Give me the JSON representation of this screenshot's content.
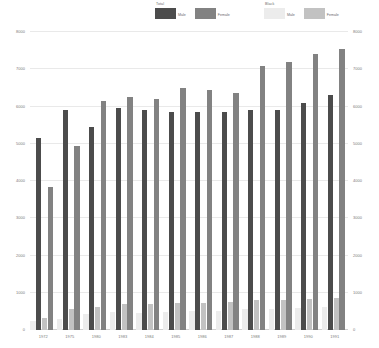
{
  "legend": {
    "groups": [
      {
        "title": "Total",
        "entries": [
          {
            "label": "Male",
            "color": "#4c4c4c"
          },
          {
            "label": "Female",
            "color": "#828282"
          }
        ]
      },
      {
        "title": "Black",
        "entries": [
          {
            "label": "Male",
            "color": "#ececec"
          },
          {
            "label": "Female",
            "color": "#c2c2c2"
          }
        ]
      }
    ]
  },
  "chart_data": {
    "type": "bar",
    "title": "",
    "xlabel": "",
    "ylabel": "",
    "ylim": [
      0,
      8000
    ],
    "y_right_lim": [
      0,
      8000
    ],
    "grid": true,
    "legend_position": "top",
    "categories": [
      "1972",
      "1975",
      "1980",
      "1983",
      "1984",
      "1985",
      "1986",
      "1987",
      "1988",
      "1989",
      "1990",
      "1991"
    ],
    "y_ticks": [
      0,
      1000,
      2000,
      3000,
      4000,
      5000,
      6000,
      7000,
      8000
    ],
    "y_ticks_right": [
      0,
      1000,
      2000,
      3000,
      4000,
      5000,
      6000,
      7000,
      8000
    ],
    "series": [
      {
        "name": "Total Male",
        "color": "#4c4c4c",
        "values": [
          5150,
          5900,
          5450,
          5950,
          5900,
          5850,
          5850,
          5850,
          5900,
          5900,
          6100,
          6300
        ]
      },
      {
        "name": "Total Female",
        "color": "#828282",
        "values": [
          3850,
          4950,
          6150,
          6250,
          6200,
          6500,
          6450,
          6350,
          7100,
          7200,
          7400,
          7550
        ]
      },
      {
        "name": "Black Male",
        "color": "#ececec",
        "values": [
          230,
          300,
          420,
          480,
          470,
          480,
          500,
          520,
          560,
          570,
          600,
          620
        ]
      },
      {
        "name": "Black Female",
        "color": "#c2c2c2",
        "values": [
          320,
          560,
          620,
          700,
          700,
          720,
          730,
          740,
          800,
          810,
          830,
          850
        ]
      }
    ]
  }
}
